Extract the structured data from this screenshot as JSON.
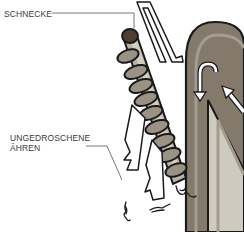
{
  "labels": {
    "schnecke": "SCHNECKE",
    "ungedroschene_line1": "UNGEDROSCHENE",
    "ungedroschene_line2": "ÄHREN"
  },
  "colors": {
    "outline": "#1a1a1a",
    "shaft_light": "#b9b3a5",
    "shaft_mid": "#9a9384",
    "housing": "#837a6c",
    "housing_light": "#a39c8f",
    "tip": "#4e3e30",
    "leader_line": "#555555",
    "arrow_fill": "#ffffff"
  }
}
